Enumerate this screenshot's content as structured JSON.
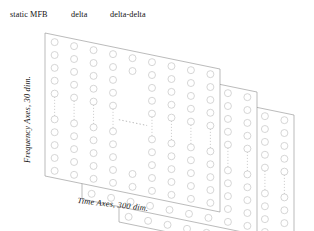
{
  "figure": {
    "type": "diagram",
    "top_labels": [
      {
        "id": "static-mfb",
        "text": "static MFB"
      },
      {
        "id": "delta",
        "text": "delta"
      },
      {
        "id": "delta-delta",
        "text": "delta-delta"
      }
    ],
    "axes": {
      "vertical": {
        "text": "Frequency Axes, 30 dim.",
        "dims": 30
      },
      "horizontal": {
        "text": "Time Axes, 300 dim.",
        "dims": 300
      }
    },
    "planes": [
      {
        "id": "plane-static-mfb",
        "label": "static MFB"
      },
      {
        "id": "plane-delta",
        "label": "delta"
      },
      {
        "id": "plane-delta-delta",
        "label": "delta-delta"
      }
    ],
    "colors": {
      "plane_stroke": "#8d8d8d",
      "circle_stroke": "#c8c8c8",
      "dot_stroke": "#b8b8b8",
      "background": "#ffffff"
    },
    "grid": {
      "columns_drawn": 9,
      "rows_drawn": 11,
      "ellipsis": "middle row and middle columns elided"
    }
  }
}
